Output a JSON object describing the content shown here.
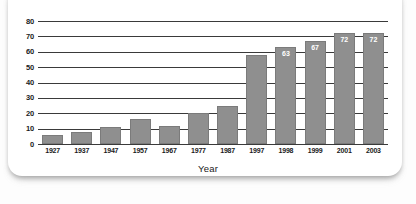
{
  "chart_data": {
    "type": "bar",
    "title": "",
    "xlabel": "Year",
    "ylabel": "",
    "categories": [
      "1927",
      "1937",
      "1947",
      "1957",
      "1967",
      "1977",
      "1987",
      "1997",
      "1998",
      "1999",
      "2001",
      "2003"
    ],
    "values": [
      6,
      8,
      11,
      16,
      12,
      20,
      25,
      58,
      63,
      67,
      72,
      72
    ],
    "data_labels": [
      "",
      "",
      "",
      "",
      "",
      "",
      "",
      "",
      "63",
      "67",
      "72",
      "72"
    ],
    "ylim": [
      0,
      80
    ],
    "ytick_labels": [
      "0",
      "10",
      "20",
      "30",
      "40",
      "50",
      "60",
      "70",
      "80"
    ],
    "ytick_values": [
      0,
      10,
      20,
      30,
      40,
      50,
      60,
      70,
      80
    ],
    "grid": true,
    "legend": "none",
    "bar_color": "#8f8f8f",
    "bar_edge_color": "#7b7b7b",
    "axis_color": "#3a3a3a",
    "label_color": "#1a1a1a",
    "data_label_color": "#ffffff",
    "background_color": "#ffffff"
  }
}
